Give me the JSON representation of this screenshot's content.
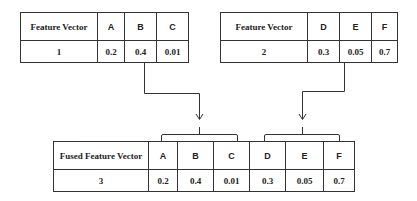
{
  "table1": {
    "header": [
      "Feature Vector",
      "A",
      "B",
      "C"
    ],
    "row": [
      "1",
      "0.2",
      "0.4",
      "0.01"
    ]
  },
  "table2": {
    "header": [
      "Feature Vector",
      "D",
      "E",
      "F"
    ],
    "row": [
      "2",
      "0.3",
      "0.05",
      "0.7"
    ]
  },
  "fused": {
    "header": [
      "Fused Feature Vector",
      "A",
      "B",
      "C",
      "D",
      "E",
      "F"
    ],
    "row": [
      "3",
      "0.2",
      "0.4",
      "0.01",
      "0.3",
      "0.05",
      "0.7"
    ]
  },
  "colors": {
    "line": "#333333",
    "background": "#ffffff"
  }
}
